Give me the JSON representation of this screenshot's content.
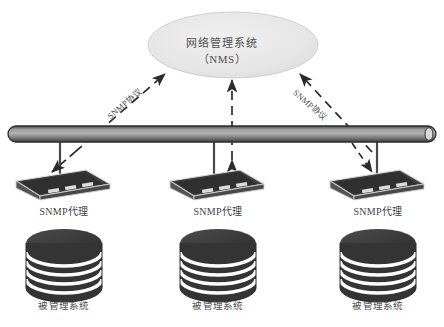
{
  "diagram": {
    "background_color": "#ffffff",
    "nms": {
      "label": "网络管理系统",
      "sublabel": "（NMS）",
      "shape": "ellipse",
      "fill_color": "#e8e8e8"
    },
    "bus": {
      "name": "network-bus",
      "color": "#6e6e6e"
    },
    "protocol_labels": [
      {
        "text": "SNMP协议",
        "side": "left"
      },
      {
        "text": "SNMP协议",
        "side": "right"
      }
    ],
    "nodes": [
      {
        "agent_label": "SNMP代理",
        "managed_label": "被管理系统",
        "device_color": "#3c3c3c",
        "disk_color": "#3a3a3a"
      },
      {
        "agent_label": "SNMP代理",
        "managed_label": "被管理系统",
        "device_color": "#3c3c3c",
        "disk_color": "#3a3a3a"
      },
      {
        "agent_label": "SNMP代理",
        "managed_label": "被管理系统",
        "device_color": "#3c3c3c",
        "disk_color": "#3a3a3a"
      }
    ]
  }
}
